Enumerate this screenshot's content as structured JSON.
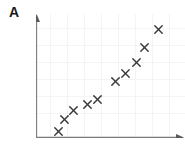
{
  "figure": {
    "panel_label": "A",
    "background_color": "#ffffff",
    "axis_color": "#7a7a7a",
    "grid_color": "#f4f4f6",
    "marker_color": "#3a3a3a"
  },
  "chart_data": {
    "type": "scatter",
    "title": "A",
    "xlabel": "",
    "ylabel": "",
    "xlim": [
      0,
      10
    ],
    "ylim": [
      0,
      10
    ],
    "grid": true,
    "legend": false,
    "tick_labels": {
      "x": [],
      "y": []
    },
    "axis_arrows": {
      "x": "right",
      "y": "up"
    },
    "marker_symbol": "x",
    "series": [
      {
        "name": "A",
        "x": [
          1.5,
          1.9,
          2.5,
          3.4,
          4.1,
          5.3,
          6.0,
          6.7,
          7.3,
          8.2
        ],
        "y": [
          0.6,
          1.5,
          2.2,
          2.6,
          3.0,
          4.4,
          5.0,
          5.9,
          7.1,
          8.5
        ]
      }
    ],
    "points": [
      {
        "x": 1.5,
        "y": 0.6,
        "px": 22,
        "py": 117
      },
      {
        "x": 1.9,
        "y": 1.5,
        "px": 28,
        "py": 105
      },
      {
        "x": 2.5,
        "y": 2.2,
        "px": 37,
        "py": 96
      },
      {
        "x": 3.4,
        "y": 2.6,
        "px": 51,
        "py": 90
      },
      {
        "x": 4.1,
        "y": 3.0,
        "px": 61,
        "py": 85
      },
      {
        "x": 5.3,
        "y": 4.4,
        "px": 79,
        "py": 67
      },
      {
        "x": 6.0,
        "y": 5.0,
        "px": 89,
        "py": 59
      },
      {
        "x": 6.7,
        "y": 5.9,
        "px": 100,
        "py": 48
      },
      {
        "x": 7.3,
        "y": 7.1,
        "px": 108,
        "py": 33
      },
      {
        "x": 8.2,
        "y": 8.5,
        "px": 122,
        "py": 15
      }
    ],
    "grid_x_px": [
      14,
      31,
      48,
      65,
      82,
      99,
      116,
      133
    ],
    "grid_y_px": [
      14,
      31,
      48,
      65,
      82,
      99
    ]
  }
}
